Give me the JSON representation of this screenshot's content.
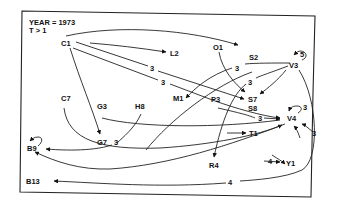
{
  "header": {
    "year_line": "YEAR = 1973",
    "threshold_line": "T > 1"
  },
  "nodes": {
    "C1": "C1",
    "L2": "L2",
    "O1": "O1",
    "S2": "S2",
    "V3": "V3",
    "C7": "C7",
    "G3": "G3",
    "H8": "H8",
    "M1": "M1",
    "P3": "P3",
    "S7": "S7",
    "S8": "S8",
    "V4": "V4",
    "G7": "G7",
    "T1": "T1",
    "B9": "B9",
    "R4": "R4",
    "Y1": "Y1",
    "B13": "B13"
  },
  "edges": [
    {
      "from": "C1",
      "to": "S2",
      "weight": ""
    },
    {
      "from": "C1",
      "to": "L2",
      "weight": ""
    },
    {
      "from": "C1",
      "to": "S7",
      "weight": "3"
    },
    {
      "from": "C1",
      "to": "V4",
      "weight": "3"
    },
    {
      "from": "C1",
      "to": "G7",
      "weight": ""
    },
    {
      "from": "O1",
      "to": "S7",
      "weight": ""
    },
    {
      "from": "V3",
      "to": "V3",
      "weight": "5"
    },
    {
      "from": "V3",
      "to": "M1",
      "weight": "3"
    },
    {
      "from": "V3",
      "to": "R4",
      "weight": "3"
    },
    {
      "from": "V3",
      "to": "S7",
      "weight": ""
    },
    {
      "from": "V3",
      "to": "B13",
      "weight": "4"
    },
    {
      "from": "P3",
      "to": "V4",
      "weight": "3"
    },
    {
      "from": "C7",
      "to": "V4",
      "weight": ""
    },
    {
      "from": "G3",
      "to": "V4",
      "weight": ""
    },
    {
      "from": "H8",
      "to": "B9",
      "weight": "3"
    },
    {
      "from": "V4",
      "to": "B9",
      "weight": ""
    },
    {
      "from": "V4",
      "to": "V4",
      "weight": "3"
    },
    {
      "from": "B9",
      "to": "B9",
      "weight": ""
    },
    {
      "from": "",
      "to": "T1",
      "weight": ""
    },
    {
      "from": "",
      "to": "V4",
      "weight": "3"
    },
    {
      "from": "",
      "to": "Y1",
      "weight": "4"
    },
    {
      "from": "",
      "to": "Y1",
      "weight": ""
    }
  ],
  "edge_labels": {
    "c1_s7": "3",
    "c1_v4": "3",
    "v3_m1": "3",
    "v3_r4": "3",
    "v3_self": "5",
    "p3_v4": "3",
    "h8_b9": "3",
    "v4_self": "3",
    "to_v4_right": "3",
    "to_y1": "4",
    "v3_b13": "4"
  }
}
